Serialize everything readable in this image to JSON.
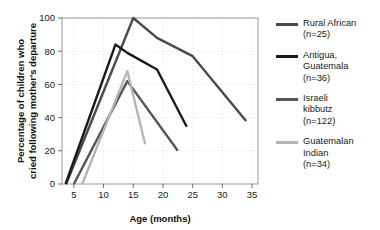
{
  "chart_data": {
    "type": "line",
    "title": "",
    "xlabel": "Age (months)",
    "ylabel": "Percentage of children who\ncried following mother's departure",
    "ylabel_line1": "Percentage of children who",
    "ylabel_line2": "cried following mother's departure",
    "xlim": [
      3,
      36
    ],
    "ylim": [
      0,
      100
    ],
    "xticks": [
      5,
      10,
      15,
      20,
      25,
      30,
      35
    ],
    "yticks": [
      0,
      20,
      40,
      60,
      80,
      100
    ],
    "grid": true,
    "legend_position": "right",
    "series": [
      {
        "name": "Rural African",
        "n_label": "(n=25)",
        "legend_label": "Rural African\n(n=25)",
        "color": "#4a4a4a",
        "x": [
          3.7,
          15,
          19,
          25,
          34
        ],
        "y": [
          0,
          100,
          88,
          77,
          38
        ]
      },
      {
        "name": "Antigua, Guatemala",
        "n_label": "(n=36)",
        "legend_label": "Antigua,\nGuatemala\n(n=36)",
        "color": "#1a1a1a",
        "x": [
          3.6,
          12,
          14,
          19,
          24
        ],
        "y": [
          0,
          84,
          79,
          69,
          34.5
        ]
      },
      {
        "name": "Israeli kibbutz",
        "n_label": "(n=122)",
        "legend_label": "Israeli\nkibbutz\n(n=122)",
        "color": "#555555",
        "x": [
          5,
          14,
          22.5
        ],
        "y": [
          0,
          62,
          20
        ]
      },
      {
        "name": "Guatemalan Indian",
        "n_label": "(n=34)",
        "legend_label": "Guatemalan\nIndian\n(n=34)",
        "color": "#b5b5b5",
        "x": [
          6.4,
          14,
          17
        ],
        "y": [
          0,
          68,
          24
        ]
      }
    ]
  },
  "axes": {
    "x_title": "Age (months)",
    "y_title_line1": "Percentage of children who",
    "y_title_line2": "cried following mother's departure",
    "x_tick_labels": [
      "5",
      "10",
      "15",
      "20",
      "25",
      "30",
      "35"
    ],
    "y_tick_labels": [
      "0",
      "20",
      "40",
      "60",
      "80",
      "100"
    ]
  },
  "legend": {
    "items": [
      {
        "label_line1": "Rural African",
        "label_line2": "(n=25)",
        "label_line3": "",
        "color": "#4a4a4a"
      },
      {
        "label_line1": "Antigua,",
        "label_line2": "Guatemala",
        "label_line3": "(n=36)",
        "color": "#1a1a1a"
      },
      {
        "label_line1": "Israeli",
        "label_line2": "kibbutz",
        "label_line3": "(n=122)",
        "color": "#555555"
      },
      {
        "label_line1": "Guatemalan",
        "label_line2": "Indian",
        "label_line3": "(n=34)",
        "color": "#b5b5b5"
      }
    ]
  }
}
